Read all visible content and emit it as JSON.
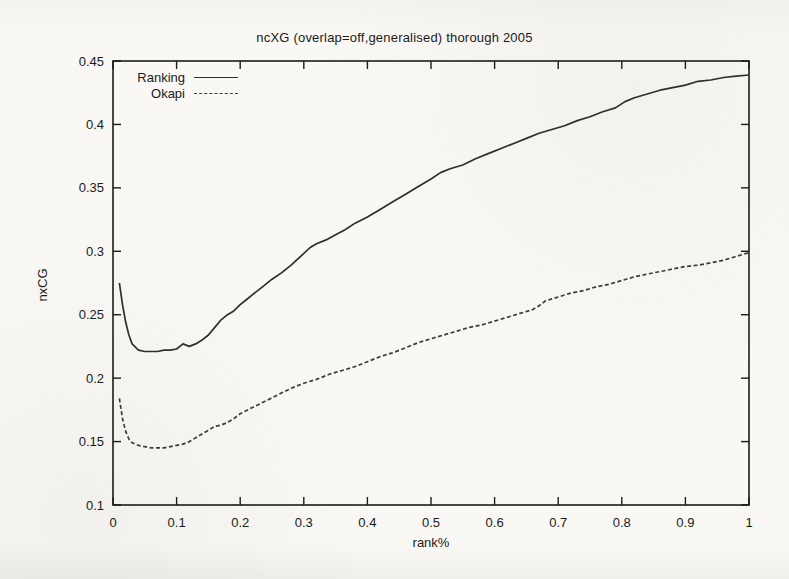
{
  "page": {
    "background_color": "#f9f8f4",
    "ink_color": "#1a1a1a"
  },
  "chart_data": {
    "type": "line",
    "title": "ncXG (overlap=off,generalised) thorough 2005",
    "xlabel": "rank%",
    "ylabel": "nxCG",
    "xlim": [
      0,
      1
    ],
    "ylim": [
      0.1,
      0.45
    ],
    "xticks": [
      "0",
      "0.1",
      "0.2",
      "0.3",
      "0.4",
      "0.5",
      "0.6",
      "0.7",
      "0.8",
      "0.9",
      "1"
    ],
    "yticks": [
      "0.1",
      "0.15",
      "0.2",
      "0.25",
      "0.3",
      "0.35",
      "0.4",
      "0.45"
    ],
    "grid": false,
    "legend_position": "top-left-inside",
    "axis_color": "#1c1c1c",
    "tick_style": "inward-mirrored",
    "series": [
      {
        "name": "Ranking",
        "line_style": "solid",
        "color": "#2e2e2e",
        "points": [
          [
            0.01,
            0.275
          ],
          [
            0.015,
            0.258
          ],
          [
            0.02,
            0.244
          ],
          [
            0.025,
            0.234
          ],
          [
            0.03,
            0.227
          ],
          [
            0.04,
            0.222
          ],
          [
            0.05,
            0.221
          ],
          [
            0.06,
            0.221
          ],
          [
            0.07,
            0.221
          ],
          [
            0.08,
            0.222
          ],
          [
            0.09,
            0.222
          ],
          [
            0.1,
            0.223
          ],
          [
            0.11,
            0.227
          ],
          [
            0.12,
            0.225
          ],
          [
            0.13,
            0.227
          ],
          [
            0.14,
            0.23
          ],
          [
            0.15,
            0.234
          ],
          [
            0.16,
            0.24
          ],
          [
            0.17,
            0.246
          ],
          [
            0.18,
            0.25
          ],
          [
            0.19,
            0.253
          ],
          [
            0.2,
            0.258
          ],
          [
            0.21,
            0.262
          ],
          [
            0.22,
            0.266
          ],
          [
            0.235,
            0.272
          ],
          [
            0.25,
            0.278
          ],
          [
            0.265,
            0.283
          ],
          [
            0.28,
            0.289
          ],
          [
            0.295,
            0.296
          ],
          [
            0.31,
            0.303
          ],
          [
            0.32,
            0.306
          ],
          [
            0.335,
            0.309
          ],
          [
            0.35,
            0.313
          ],
          [
            0.365,
            0.317
          ],
          [
            0.38,
            0.322
          ],
          [
            0.4,
            0.327
          ],
          [
            0.42,
            0.333
          ],
          [
            0.44,
            0.339
          ],
          [
            0.46,
            0.345
          ],
          [
            0.48,
            0.351
          ],
          [
            0.5,
            0.357
          ],
          [
            0.515,
            0.362
          ],
          [
            0.53,
            0.365
          ],
          [
            0.55,
            0.368
          ],
          [
            0.57,
            0.373
          ],
          [
            0.59,
            0.377
          ],
          [
            0.61,
            0.381
          ],
          [
            0.63,
            0.385
          ],
          [
            0.65,
            0.389
          ],
          [
            0.67,
            0.393
          ],
          [
            0.69,
            0.396
          ],
          [
            0.71,
            0.399
          ],
          [
            0.73,
            0.403
          ],
          [
            0.75,
            0.406
          ],
          [
            0.77,
            0.41
          ],
          [
            0.79,
            0.413
          ],
          [
            0.805,
            0.418
          ],
          [
            0.82,
            0.421
          ],
          [
            0.84,
            0.424
          ],
          [
            0.86,
            0.427
          ],
          [
            0.88,
            0.429
          ],
          [
            0.9,
            0.431
          ],
          [
            0.92,
            0.434
          ],
          [
            0.94,
            0.435
          ],
          [
            0.96,
            0.437
          ],
          [
            0.98,
            0.438
          ],
          [
            1.0,
            0.439
          ]
        ]
      },
      {
        "name": "Okapi",
        "line_style": "dashed",
        "color": "#3c3c3c",
        "points": [
          [
            0.01,
            0.184
          ],
          [
            0.015,
            0.168
          ],
          [
            0.02,
            0.158
          ],
          [
            0.025,
            0.152
          ],
          [
            0.03,
            0.149
          ],
          [
            0.04,
            0.147
          ],
          [
            0.05,
            0.146
          ],
          [
            0.06,
            0.145
          ],
          [
            0.07,
            0.145
          ],
          [
            0.08,
            0.145
          ],
          [
            0.09,
            0.146
          ],
          [
            0.1,
            0.147
          ],
          [
            0.11,
            0.148
          ],
          [
            0.12,
            0.15
          ],
          [
            0.13,
            0.153
          ],
          [
            0.14,
            0.156
          ],
          [
            0.15,
            0.159
          ],
          [
            0.16,
            0.162
          ],
          [
            0.17,
            0.163
          ],
          [
            0.18,
            0.165
          ],
          [
            0.19,
            0.168
          ],
          [
            0.2,
            0.172
          ],
          [
            0.22,
            0.177
          ],
          [
            0.24,
            0.182
          ],
          [
            0.26,
            0.187
          ],
          [
            0.28,
            0.192
          ],
          [
            0.3,
            0.196
          ],
          [
            0.32,
            0.199
          ],
          [
            0.34,
            0.203
          ],
          [
            0.36,
            0.206
          ],
          [
            0.38,
            0.209
          ],
          [
            0.4,
            0.213
          ],
          [
            0.42,
            0.217
          ],
          [
            0.44,
            0.22
          ],
          [
            0.46,
            0.224
          ],
          [
            0.48,
            0.228
          ],
          [
            0.5,
            0.231
          ],
          [
            0.52,
            0.234
          ],
          [
            0.54,
            0.237
          ],
          [
            0.56,
            0.24
          ],
          [
            0.58,
            0.242
          ],
          [
            0.6,
            0.245
          ],
          [
            0.62,
            0.248
          ],
          [
            0.64,
            0.251
          ],
          [
            0.66,
            0.254
          ],
          [
            0.67,
            0.257
          ],
          [
            0.68,
            0.261
          ],
          [
            0.7,
            0.264
          ],
          [
            0.72,
            0.267
          ],
          [
            0.74,
            0.269
          ],
          [
            0.76,
            0.272
          ],
          [
            0.78,
            0.274
          ],
          [
            0.8,
            0.277
          ],
          [
            0.82,
            0.28
          ],
          [
            0.84,
            0.282
          ],
          [
            0.86,
            0.284
          ],
          [
            0.88,
            0.286
          ],
          [
            0.9,
            0.288
          ],
          [
            0.92,
            0.289
          ],
          [
            0.94,
            0.291
          ],
          [
            0.96,
            0.293
          ],
          [
            0.98,
            0.296
          ],
          [
            1.0,
            0.299
          ]
        ]
      }
    ]
  }
}
